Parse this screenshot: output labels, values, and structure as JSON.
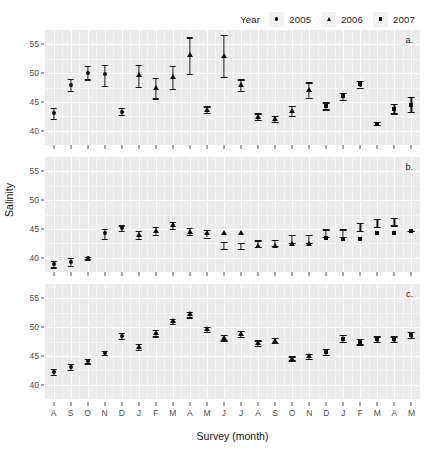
{
  "chart_data": {
    "type": "scatter",
    "title": "",
    "xlabel": "Survey (month)",
    "ylabel": "Salinity",
    "ylim": [
      37.5,
      57.5
    ],
    "yticks": [
      40,
      45,
      50,
      55
    ],
    "grid": true,
    "legend": {
      "title": "Year",
      "position": "top-right",
      "entries": [
        {
          "label": "2005",
          "marker": "circle"
        },
        {
          "label": "2006",
          "marker": "triangle"
        },
        {
          "label": "2007",
          "marker": "square"
        }
      ]
    },
    "categories": [
      "A",
      "S",
      "O",
      "N",
      "D",
      "J",
      "F",
      "M",
      "A",
      "M",
      "J",
      "J",
      "A",
      "S",
      "O",
      "N",
      "D",
      "J",
      "F",
      "M",
      "A",
      "M"
    ],
    "point_years": [
      "2005",
      "2005",
      "2005",
      "2005",
      "2005",
      "2006",
      "2006",
      "2006",
      "2006",
      "2006",
      "2006",
      "2006",
      "2006",
      "2006",
      "2006",
      "2006",
      "2007",
      "2007",
      "2007",
      "2007",
      "2007",
      "2007"
    ],
    "panels": [
      {
        "tag": "a.",
        "series": [
          {
            "name": "Salinity",
            "values": [
              43.0,
              48.0,
              50.1,
              49.8,
              43.3,
              49.6,
              47.4,
              49.4,
              53.2,
              43.6,
              53.0,
              47.9,
              42.4,
              42.0,
              43.4,
              47.0,
              44.3,
              46.0,
              48.1,
              41.2,
              43.8,
              44.5
            ]
          }
        ],
        "errors_low": [
          42.0,
          46.9,
          48.9,
          47.8,
          42.8,
          47.6,
          45.6,
          47.3,
          49.8,
          43.1,
          49.3,
          46.9,
          41.8,
          41.5,
          42.6,
          45.7,
          43.7,
          45.4,
          47.5,
          41.0,
          43.0,
          43.3
        ],
        "errors_high": [
          43.9,
          49.0,
          51.3,
          51.4,
          43.9,
          51.4,
          49.1,
          51.3,
          56.2,
          44.2,
          56.6,
          48.9,
          43.0,
          42.6,
          44.3,
          48.4,
          44.9,
          46.6,
          48.7,
          41.5,
          44.7,
          45.9
        ]
      },
      {
        "tag": "b.",
        "series": [
          {
            "name": "Salinity",
            "values": [
              38.9,
              39.2,
              39.9,
              44.2,
              45.2,
              43.9,
              44.7,
              45.6,
              44.5,
              44.2,
              44.2,
              44.2,
              42.1,
              42.1,
              42.3,
              42.3,
              43.5,
              43.2,
              43.3,
              44.3,
              44.3,
              44.6,
              45.4,
              46.0,
              46.3
            ]
          }
        ],
        "errors_low": [
          38.3,
          38.5,
          39.7,
          43.3,
          44.7,
          43.2,
          44.0,
          45.0,
          43.9,
          43.5,
          41.5,
          41.5,
          41.8,
          42.1,
          42.6,
          42.6,
          43.6,
          43.6,
          44.7,
          45.3,
          45.6
        ],
        "errors_high": [
          39.4,
          39.9,
          40.1,
          45.0,
          45.6,
          44.6,
          45.3,
          46.2,
          45.1,
          44.8,
          42.7,
          42.6,
          43.0,
          43.1,
          44.0,
          44.0,
          44.9,
          44.9,
          46.0,
          46.7,
          46.9
        ]
      },
      {
        "tag": "c.",
        "series": [
          {
            "name": "Salinity",
            "values": [
              42.2,
              43.1,
              44.1,
              45.5,
              48.5,
              46.6,
              49.0,
              51.0,
              52.2,
              49.6,
              48.1,
              48.8,
              47.2,
              47.6,
              44.5,
              44.9,
              45.7,
              48.0,
              47.5,
              47.9,
              47.9,
              48.6,
              46.2,
              44.2
            ]
          }
        ],
        "errors_low": [
          41.7,
          42.6,
          43.7,
          45.2,
          48.0,
          46.1,
          48.4,
          50.5,
          51.7,
          49.1,
          47.7,
          48.3,
          46.8,
          47.2,
          44.2,
          44.5,
          45.2,
          47.4,
          47.0,
          47.4,
          47.4,
          48.1,
          45.7,
          43.7
        ],
        "errors_high": [
          42.7,
          43.6,
          44.5,
          45.9,
          49.0,
          47.1,
          49.5,
          51.5,
          52.7,
          50.1,
          48.6,
          49.3,
          47.7,
          48.1,
          44.9,
          45.3,
          46.2,
          48.6,
          48.0,
          48.4,
          48.4,
          49.1,
          46.7,
          44.7
        ]
      }
    ]
  }
}
